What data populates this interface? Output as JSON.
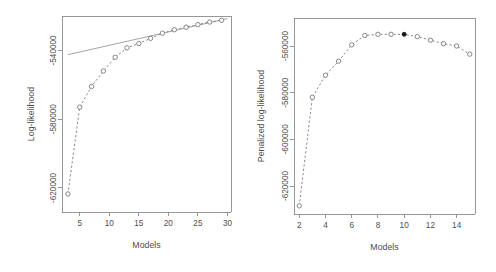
{
  "figure": {
    "background_color": "#ffffff",
    "line_color": "#7a7a7a",
    "axis_color": "#8c8c8c",
    "text_color": "#4d4d4d",
    "highlight_color": "#1a1a1a",
    "panel_count": 2
  },
  "chart_data": [
    {
      "type": "line",
      "panel": "left",
      "title": "",
      "xlabel": "Models",
      "ylabel": "Log-likelihood",
      "xlim": [
        2.0,
        30.6
      ],
      "ylim": [
        -634000,
        -520000
      ],
      "xticks": [
        5,
        10,
        15,
        20,
        25,
        30
      ],
      "xtick_labels": [
        "5",
        "10",
        "15",
        "20",
        "25",
        "30"
      ],
      "yticks": [
        -540000,
        -580000,
        -620000
      ],
      "ytick_labels": [
        "-540000",
        "-580000",
        "-620000"
      ],
      "grid": false,
      "legend": false,
      "marker": "open-circle",
      "linestyle": "dashed",
      "series": [
        {
          "name": "Log-likelihood",
          "x": [
            3,
            5,
            7,
            9,
            11,
            13,
            15,
            17,
            19,
            21,
            23,
            25,
            27,
            29
          ],
          "values": [
            -623500,
            -573000,
            -561000,
            -552000,
            -544000,
            -538500,
            -536000,
            -533000,
            -530000,
            -528000,
            -526500,
            -525000,
            -523500,
            -522500
          ]
        }
      ],
      "reference_line": {
        "name": "reference-line",
        "x": [
          3,
          30
        ],
        "values": [
          -542500,
          -521500
        ],
        "linestyle": "solid"
      }
    },
    {
      "type": "line",
      "panel": "right",
      "title": "",
      "xlabel": "Models",
      "ylabel": "Penalized log-likelihood",
      "xlim": [
        1.6,
        15.4
      ],
      "ylim": [
        -632000,
        -548000
      ],
      "xticks": [
        2,
        4,
        6,
        8,
        10,
        12,
        14
      ],
      "xtick_labels": [
        "2",
        "4",
        "6",
        "8",
        "10",
        "12",
        "14"
      ],
      "yticks": [
        -560000,
        -580000,
        -600000,
        -620000
      ],
      "ytick_labels": [
        "-560000",
        "-580000",
        "-600000",
        "-620000"
      ],
      "grid": false,
      "legend": false,
      "marker": "open-circle",
      "linestyle": "dashed",
      "series": [
        {
          "name": "Penalized log-likelihood",
          "x": [
            2,
            3,
            4,
            5,
            6,
            7,
            8,
            9,
            10,
            11,
            12,
            13,
            14,
            15
          ],
          "values": [
            -628500,
            -582000,
            -572500,
            -566500,
            -559500,
            -555500,
            -555000,
            -555000,
            -555000,
            -556000,
            -557500,
            -559000,
            -560000,
            -563500
          ]
        }
      ],
      "highlighted_point": {
        "name": "selected-model",
        "x": 10,
        "y": -555000,
        "marker": "filled-circle"
      }
    }
  ]
}
